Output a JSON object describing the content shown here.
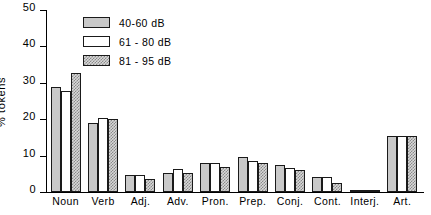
{
  "chart_data": {
    "type": "bar",
    "title": "",
    "xlabel": "",
    "ylabel": "% tokens",
    "ylim": [
      0,
      50
    ],
    "yticks": [
      0,
      10,
      20,
      30,
      40,
      50
    ],
    "grid": false,
    "legend_position": "top-left-inside",
    "categories": [
      "Noun",
      "Verb",
      "Adj.",
      "Adv.",
      "Pron.",
      "Prep.",
      "Conj.",
      "Cont.",
      "Interj.",
      "Art."
    ],
    "series": [
      {
        "name": "40-60 dB",
        "style": "solid-gray",
        "values": [
          28.8,
          19.0,
          4.8,
          5.2,
          8.0,
          9.5,
          7.4,
          4.0,
          0.5,
          15.5
        ]
      },
      {
        "name": "61 - 80 dB",
        "style": "white",
        "values": [
          27.8,
          20.4,
          4.8,
          6.2,
          8.0,
          8.5,
          6.5,
          4.0,
          0.5,
          15.5
        ]
      },
      {
        "name": "81 - 95 dB",
        "style": "hatched",
        "values": [
          32.8,
          20.0,
          3.6,
          5.2,
          7.0,
          8.0,
          6.0,
          2.6,
          0.5,
          15.5
        ]
      }
    ]
  },
  "legend": {
    "items": [
      {
        "label": "40-60 dB"
      },
      {
        "label": "61 - 80 dB"
      },
      {
        "label": "81 - 95 dB"
      }
    ]
  }
}
